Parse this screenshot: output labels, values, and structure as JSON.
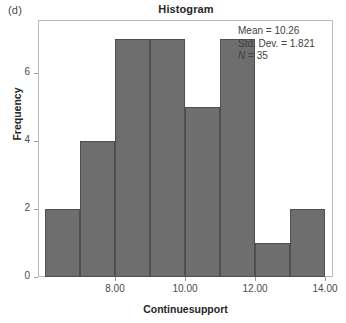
{
  "panel": {
    "letter": "(d)"
  },
  "chart": {
    "title": "Histogram",
    "xlabel": "Continuesupport",
    "ylabel": "Frequency"
  },
  "stats": {
    "mean_line": "Mean = 10.26",
    "stddev_line": "Std. Dev. = 1.821",
    "n_symbol": "N",
    "n_line": " = 35"
  },
  "axes": {
    "y_ticks": [
      "0",
      "2",
      "4",
      "6"
    ],
    "x_ticks": [
      "8.00",
      "10.00",
      "12.00",
      "14.00"
    ]
  },
  "colors": {
    "bar_fill": "#6e6e6e",
    "bar_edge": "#4f4f4f",
    "frame": "#b9bcc0",
    "text": "#3a3a3a"
  },
  "chart_data": {
    "type": "bar",
    "title": "Histogram",
    "xlabel": "Continuesupport",
    "ylabel": "Frequency",
    "categories": [
      "6.0-7.0",
      "7.0-8.0",
      "8.0-9.0",
      "9.0-10.0",
      "10.0-11.0",
      "11.0-12.0",
      "12.0-13.0",
      "13.0-14.0"
    ],
    "bin_centers": [
      6.5,
      7.5,
      8.5,
      9.5,
      10.5,
      11.5,
      12.5,
      13.5
    ],
    "bin_edges": [
      6.0,
      7.0,
      8.0,
      9.0,
      10.0,
      11.0,
      12.0,
      13.0,
      14.0
    ],
    "values": [
      2,
      4,
      7,
      7,
      5,
      7,
      1,
      2
    ],
    "bin_width": 1.0,
    "xlim": [
      6.0,
      14.0
    ],
    "ylim": [
      0,
      7.5
    ],
    "x_ticks": [
      8.0,
      10.0,
      12.0,
      14.0
    ],
    "y_ticks": [
      0,
      2,
      4,
      6
    ],
    "grid": false,
    "legend": "none",
    "annotations": [
      "Mean = 10.26",
      "Std. Dev. = 1.821",
      "N = 35"
    ],
    "summary": {
      "mean": 10.26,
      "std_dev": 1.821,
      "n": 35
    }
  }
}
